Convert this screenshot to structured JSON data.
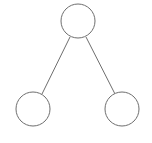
{
  "diagram": {
    "type": "tree",
    "colors": {
      "stroke": "#6e6e6e",
      "fill": "#ffffff",
      "background": "#ffffff"
    },
    "nodes": [
      {
        "id": "root",
        "label": "",
        "cx": 78,
        "cy": 21,
        "r": 17
      },
      {
        "id": "left-child",
        "label": "",
        "cx": 33,
        "cy": 109,
        "r": 17
      },
      {
        "id": "right-child",
        "label": "",
        "cx": 122,
        "cy": 109,
        "r": 17
      }
    ],
    "edges": [
      {
        "from": "root",
        "to": "left-child",
        "x1": 70,
        "y1": 37,
        "x2": 42,
        "y2": 94
      },
      {
        "from": "root",
        "to": "right-child",
        "x1": 86,
        "y1": 37,
        "x2": 115,
        "y2": 94
      }
    ]
  }
}
